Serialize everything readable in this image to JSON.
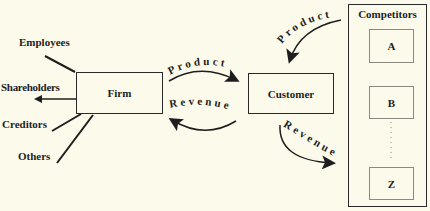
{
  "stakeholders": [
    {
      "label": "Employees"
    },
    {
      "label": "Shareholders"
    },
    {
      "label": "Creditors"
    },
    {
      "label": "Others"
    }
  ],
  "firm": {
    "label": "Firm"
  },
  "customer": {
    "label": "Customer"
  },
  "flows": {
    "firm_to_customer": "Product",
    "customer_to_firm": "Revenue",
    "competitor_to_customer": "Product",
    "customer_to_competitor": "Revenue"
  },
  "competitors": {
    "title": "Competitors",
    "items": [
      {
        "label": "A"
      },
      {
        "label": "B"
      },
      {
        "label": "Z"
      }
    ],
    "ellipsis": "dotted-continuation"
  },
  "colors": {
    "background": "#fcfbeb",
    "stroke": "#1e1e1e"
  }
}
